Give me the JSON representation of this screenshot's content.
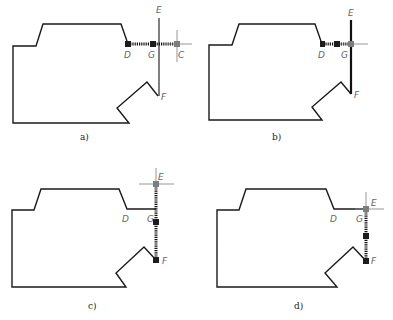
{
  "figure": {
    "panels": [
      {
        "id": "a",
        "caption": "a)",
        "points": {
          "D": "D",
          "G": "G",
          "E": "E",
          "F": "F",
          "C": "C"
        }
      },
      {
        "id": "b",
        "caption": "b)",
        "points": {
          "D": "D",
          "G": "G",
          "E": "E",
          "F": "F"
        }
      },
      {
        "id": "c",
        "caption": "c)",
        "points": {
          "D": "D",
          "G": "G",
          "E": "E",
          "F": "F"
        }
      },
      {
        "id": "d",
        "caption": "d)",
        "points": {
          "D": "D",
          "G": "G",
          "E": "E",
          "F": "F"
        }
      }
    ],
    "colors": {
      "outline": "#1a1a1a",
      "grip_selected": "#1c1c1c",
      "grip_hot": "#7d7d7d",
      "crosshair": "#8a8a8a"
    }
  }
}
